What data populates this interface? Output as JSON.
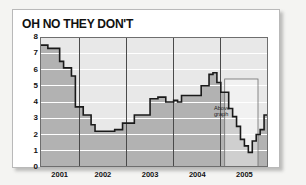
{
  "card": {
    "title": "OH NO THEY DON'T"
  },
  "annotation": {
    "label": "Above\ngraph"
  },
  "colors": {
    "card_background": "#ffffff",
    "card_border": "#b9b9b9",
    "page_background": "#f4f4f2",
    "plot_upper_background": "#e8e8e8",
    "area_fill": "#b2b2b2",
    "line": "#1a1a1a",
    "gridline": "#ffffff",
    "year_divider": "#4a4a4a",
    "text": "#111111"
  },
  "chart_data": {
    "type": "area",
    "title": "OH NO THEY DON'T",
    "xlabel": "",
    "ylabel": "%",
    "ylim": [
      0,
      8
    ],
    "yticks": [
      0,
      1,
      2,
      3,
      4,
      5,
      6,
      7,
      8
    ],
    "grid": true,
    "legend": null,
    "xlim": [
      "2000-09",
      "2005-06"
    ],
    "xticks": [
      "2001",
      "2002",
      "2003",
      "2004",
      "2005"
    ],
    "tick_labels": [
      "2001",
      "2002",
      "2003",
      "2004",
      "2005"
    ],
    "year_dividers": [
      "2001-07",
      "2002-07",
      "2003-07",
      "2004-07"
    ],
    "annotations": [
      {
        "text": "Above graph",
        "x": "2004-09",
        "y": 4.3
      }
    ],
    "series": [
      {
        "name": "Rate",
        "x": [
          "2000-09",
          "2000-10",
          "2000-11",
          "2000-12",
          "2001-01",
          "2001-02",
          "2001-03",
          "2001-04",
          "2001-05",
          "2001-06",
          "2001-07",
          "2001-08",
          "2001-09",
          "2001-10",
          "2001-11",
          "2001-12",
          "2002-01",
          "2002-02",
          "2002-03",
          "2002-04",
          "2002-05",
          "2002-06",
          "2002-07",
          "2002-08",
          "2002-09",
          "2002-10",
          "2002-11",
          "2002-12",
          "2003-01",
          "2003-02",
          "2003-03",
          "2003-04",
          "2003-05",
          "2003-06",
          "2003-07",
          "2003-08",
          "2003-09",
          "2003-10",
          "2003-11",
          "2003-12",
          "2004-01",
          "2004-02",
          "2004-03",
          "2004-04",
          "2004-05",
          "2004-06",
          "2004-07",
          "2004-08",
          "2004-09",
          "2004-10",
          "2004-11",
          "2004-12",
          "2005-01",
          "2005-02",
          "2005-03",
          "2005-04",
          "2005-05",
          "2005-06"
        ],
        "values": [
          7.5,
          7.5,
          7.3,
          7.3,
          7.3,
          6.5,
          6.1,
          6.1,
          5.6,
          3.7,
          3.7,
          3.2,
          3.2,
          2.6,
          2.2,
          2.2,
          2.2,
          2.2,
          2.2,
          2.3,
          2.3,
          2.7,
          2.7,
          2.7,
          3.2,
          3.2,
          3.2,
          3.2,
          4.2,
          4.2,
          4.3,
          4.3,
          4.0,
          4.0,
          4.1,
          4.0,
          4.4,
          4.4,
          4.4,
          4.4,
          4.4,
          5.0,
          5.0,
          5.7,
          5.8,
          5.2,
          4.6,
          4.6,
          3.6,
          3.1,
          2.5,
          1.7,
          1.3,
          0.9,
          1.6,
          2.0,
          2.3,
          3.2
        ]
      }
    ]
  }
}
